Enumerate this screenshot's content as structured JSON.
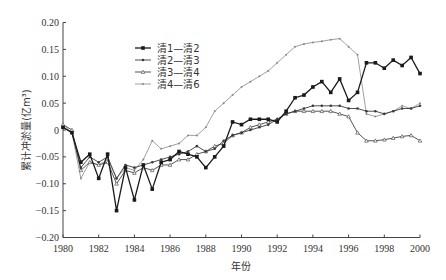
{
  "chart_data": {
    "type": "line",
    "title": "",
    "xlabel": "年份",
    "ylabel": "累计冲淤量(亿m³)",
    "xlim": [
      1980,
      2000
    ],
    "ylim": [
      -0.2,
      0.2
    ],
    "x_ticks": [
      "1980",
      "1982",
      "1984",
      "1986",
      "1988",
      "1990",
      "1992",
      "1994",
      "1996",
      "1998",
      "2000"
    ],
    "y_ticks": [
      "0.20",
      "0.15",
      "0.10",
      "0.05",
      "0",
      "-0.05",
      "-0.10",
      "-0.15",
      "-0.20"
    ],
    "grid": false,
    "legend_position": "upper-left",
    "x": [
      1980,
      1980.5,
      1981,
      1981.5,
      1982,
      1982.5,
      1983,
      1983.5,
      1984,
      1984.5,
      1985,
      1985.5,
      1986,
      1986.5,
      1987,
      1987.5,
      1988,
      1988.5,
      1989,
      1989.5,
      1990,
      1990.5,
      1991,
      1991.5,
      1992,
      1992.5,
      1993,
      1993.5,
      1994,
      1994.5,
      1995,
      1995.5,
      1996,
      1996.5,
      1997,
      1997.5,
      1998,
      1998.5,
      1999,
      1999.5,
      2000
    ],
    "series": [
      {
        "name": "清1—清2",
        "color": "#1a1a1a",
        "marker": "square-filled",
        "values": [
          0.005,
          -0.005,
          -0.06,
          -0.045,
          -0.09,
          -0.045,
          -0.15,
          -0.07,
          -0.13,
          -0.065,
          -0.11,
          -0.06,
          -0.055,
          -0.04,
          -0.045,
          -0.05,
          -0.07,
          -0.05,
          -0.03,
          0.015,
          0.01,
          0.02,
          0.02,
          0.02,
          0.015,
          0.035,
          0.06,
          0.065,
          0.08,
          0.09,
          0.07,
          0.095,
          0.055,
          0.07,
          0.125,
          0.125,
          0.115,
          0.13,
          0.12,
          0.135,
          0.105
        ]
      },
      {
        "name": "清2—清3",
        "color": "#3a3a3a",
        "marker": "dot",
        "values": [
          0.005,
          -0.005,
          -0.07,
          -0.05,
          -0.06,
          -0.05,
          -0.09,
          -0.065,
          -0.07,
          -0.065,
          -0.06,
          -0.055,
          -0.05,
          -0.045,
          -0.04,
          -0.03,
          -0.04,
          -0.035,
          -0.02,
          -0.01,
          -0.005,
          0.0,
          0.005,
          0.01,
          0.02,
          0.03,
          0.035,
          0.04,
          0.045,
          0.045,
          0.045,
          0.045,
          0.04,
          0.04,
          0.035,
          0.035,
          0.03,
          0.035,
          0.04,
          0.04,
          0.045
        ]
      },
      {
        "name": "清3—清4",
        "color": "#555555",
        "marker": "triangle",
        "values": [
          0.01,
          0.0,
          -0.075,
          -0.06,
          -0.065,
          -0.06,
          -0.1,
          -0.075,
          -0.08,
          -0.07,
          -0.075,
          -0.065,
          -0.065,
          -0.055,
          -0.055,
          -0.045,
          -0.04,
          -0.03,
          -0.025,
          -0.01,
          -0.005,
          0.005,
          0.01,
          0.015,
          0.02,
          0.03,
          0.035,
          0.035,
          0.035,
          0.035,
          0.035,
          0.03,
          0.025,
          -0.005,
          -0.02,
          -0.02,
          -0.018,
          -0.015,
          -0.012,
          -0.01,
          -0.02
        ]
      },
      {
        "name": "清4—清6",
        "color": "#888888",
        "marker": "small-dot",
        "values": [
          0.01,
          -0.005,
          -0.09,
          -0.06,
          -0.065,
          -0.055,
          -0.09,
          -0.07,
          -0.075,
          -0.055,
          -0.02,
          -0.035,
          -0.03,
          -0.025,
          -0.01,
          -0.01,
          0.005,
          0.035,
          0.05,
          0.065,
          0.08,
          0.09,
          0.1,
          0.11,
          0.125,
          0.14,
          0.155,
          0.16,
          0.163,
          0.165,
          0.168,
          0.17,
          0.155,
          0.14,
          0.03,
          0.025,
          0.03,
          0.035,
          0.045,
          0.04,
          0.05
        ]
      }
    ]
  }
}
